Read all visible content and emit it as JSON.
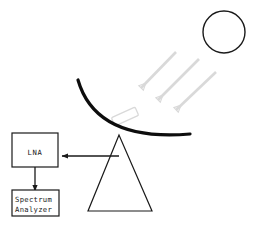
{
  "diagram": {
    "canvas": {
      "width": 257,
      "height": 230,
      "background": "#ffffff"
    },
    "colors": {
      "stroke_dark": "#1a1a1a",
      "dish_black": "#0d0d0d",
      "ray_gray": "#d9d9d9",
      "feed_gray": "#d9d9d9",
      "box_fill": "#ffffff",
      "text": "#1a1a1a"
    },
    "components": {
      "sun": {
        "label": "sun",
        "shape": "circle",
        "cx": 224,
        "cy": 32,
        "r": 21,
        "stroke_width": 1.4
      },
      "dish": {
        "label": "parabolic reflector dish",
        "shape": "arc",
        "stroke_width": 3.2,
        "start": [
          78,
          80
        ],
        "control": [
          96,
          142
        ],
        "end": [
          190,
          134
        ]
      },
      "feed_horn": {
        "label": "feed horn",
        "shape": "rotated-rectangle",
        "x": 112,
        "y": 112,
        "width": 26,
        "height": 9,
        "rotation_deg": -24
      },
      "mount": {
        "label": "tripod mount",
        "shape": "triangle",
        "apex": [
          119,
          135
        ],
        "left": [
          88,
          211
        ],
        "right": [
          152,
          211
        ],
        "stroke_width": 1.2
      },
      "lna": {
        "label": "LNA",
        "text": "LNA",
        "x": 12,
        "y": 133,
        "width": 46,
        "height": 34
      },
      "spectrum_analyzer": {
        "label": "Spectrum Analyzer",
        "line1": "Spectrum",
        "line2": "Analyzer",
        "x": 12,
        "y": 190,
        "width": 47,
        "height": 26
      }
    },
    "rays": {
      "label": "incoming solar radiation rays",
      "count": 3,
      "direction": "down-left",
      "stroke": "#d9d9d9",
      "items": [
        {
          "name": "ray-1",
          "x1": 176,
          "y1": 52,
          "x2": 141,
          "y2": 88
        },
        {
          "name": "ray-2",
          "x1": 199,
          "y1": 59,
          "x2": 158,
          "y2": 100
        },
        {
          "name": "ray-3",
          "x1": 216,
          "y1": 72,
          "x2": 176,
          "y2": 110
        }
      ]
    },
    "connections": [
      {
        "name": "feed-to-lna",
        "label": "signal from feed to LNA",
        "from": [
          119,
          156
        ],
        "to": [
          60,
          156
        ],
        "arrow_at": "to",
        "orientation": "horizontal-left"
      },
      {
        "name": "lna-to-spectrum-analyzer",
        "label": "signal from LNA to Spectrum Analyzer",
        "from": [
          35,
          167
        ],
        "to": [
          35,
          189
        ],
        "arrow_at": "to",
        "orientation": "vertical-down"
      }
    ]
  }
}
